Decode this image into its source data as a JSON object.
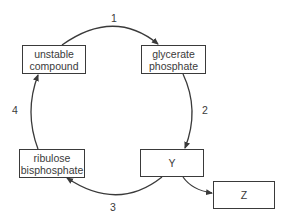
{
  "diagram": {
    "type": "cycle",
    "nodes": [
      {
        "id": "unstable_compound",
        "lines": [
          "unstable",
          "compound"
        ]
      },
      {
        "id": "glycerate_phosphate",
        "lines": [
          "glycerate",
          "phosphate"
        ]
      },
      {
        "id": "y",
        "lines": [
          "Y"
        ]
      },
      {
        "id": "ribulose_bisphosphate",
        "lines": [
          "ribulose",
          "bisphosphate"
        ]
      },
      {
        "id": "z",
        "lines": [
          "Z"
        ]
      }
    ],
    "edges": [
      {
        "from": "unstable_compound",
        "to": "glycerate_phosphate",
        "label": "1"
      },
      {
        "from": "glycerate_phosphate",
        "to": "y",
        "label": "2"
      },
      {
        "from": "y",
        "to": "ribulose_bisphosphate",
        "label": "3"
      },
      {
        "from": "ribulose_bisphosphate",
        "to": "unstable_compound",
        "label": "4"
      },
      {
        "from": "y",
        "to": "z",
        "label": ""
      }
    ],
    "colors": {
      "stroke": "#3a3a3a",
      "background": "#ffffff"
    }
  }
}
